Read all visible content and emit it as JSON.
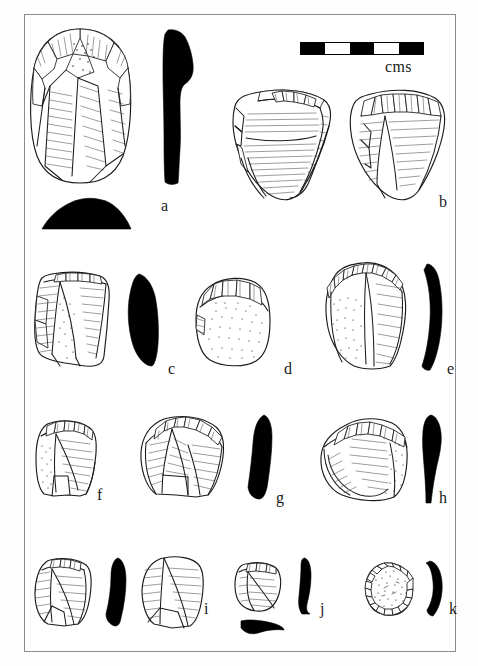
{
  "figure": {
    "kind": "archaeological-lithic-plate",
    "background_color": "#ffffff",
    "ink_color": "#1b1b1b",
    "frame": {
      "visible": true,
      "color": "#8c8c8c"
    }
  },
  "scale": {
    "unit_label": "cms",
    "segments": 5,
    "segment_pattern": [
      "black",
      "white",
      "black",
      "white",
      "black"
    ],
    "bar_color": "#000000"
  },
  "artifacts": [
    {
      "id": "a",
      "label": "a",
      "views": [
        "plan",
        "side-profile",
        "basal-section"
      ],
      "profile_shape": "elongated curved silhouette",
      "cortex": "partial",
      "row": 1
    },
    {
      "id": "b",
      "label": "b",
      "views": [
        "plan-obverse",
        "plan-reverse"
      ],
      "profile_shape": "none",
      "cortex": "none",
      "row": 1
    },
    {
      "id": "c",
      "label": "c",
      "views": [
        "plan",
        "side-profile"
      ],
      "profile_shape": "triangular silhouette",
      "cortex": "partial",
      "row": 2
    },
    {
      "id": "d",
      "label": "d",
      "views": [
        "plan"
      ],
      "profile_shape": "none",
      "cortex": "stippled overall",
      "row": 2
    },
    {
      "id": "e",
      "label": "e",
      "views": [
        "plan",
        "side-profile"
      ],
      "profile_shape": "long crescent silhouette",
      "cortex": "partial",
      "row": 2
    },
    {
      "id": "f",
      "label": "f",
      "views": [
        "plan"
      ],
      "profile_shape": "none",
      "cortex": "partial",
      "row": 3
    },
    {
      "id": "g",
      "label": "g",
      "views": [
        "plan",
        "side-profile"
      ],
      "profile_shape": "curved silhouette",
      "cortex": "none",
      "row": 3
    },
    {
      "id": "h",
      "label": "h",
      "views": [
        "plan",
        "side-profile"
      ],
      "profile_shape": "tapering wedge silhouette",
      "cortex": "partial",
      "row": 3
    },
    {
      "id": "i",
      "label": "i",
      "views": [
        "plan",
        "side-profile",
        "second-plan"
      ],
      "profile_shape": "curved silhouette",
      "cortex": "none",
      "row": 4
    },
    {
      "id": "j",
      "label": "j",
      "views": [
        "plan",
        "side-profile",
        "basal-section"
      ],
      "profile_shape": "hooked silhouette",
      "cortex": "none",
      "row": 4
    },
    {
      "id": "k",
      "label": "k",
      "views": [
        "plan",
        "side-profile"
      ],
      "profile_shape": "crescent silhouette",
      "cortex": "stippled overall",
      "row": 4
    }
  ]
}
